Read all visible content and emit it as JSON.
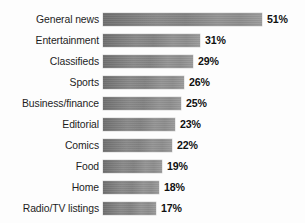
{
  "chart_data": {
    "type": "bar",
    "orientation": "horizontal",
    "title": "",
    "xlabel": "",
    "ylabel": "",
    "xlim": [
      0,
      51
    ],
    "grid": false,
    "legend": false,
    "value_suffix": "%",
    "categories": [
      "General news",
      "Entertainment",
      "Classifieds",
      "Sports",
      "Business/finance",
      "Editorial",
      "Comics",
      "Food",
      "Home",
      "Radio/TV listings"
    ],
    "values": [
      51,
      31,
      29,
      26,
      25,
      23,
      22,
      19,
      18,
      17
    ],
    "value_labels": [
      "51%",
      "31%",
      "29%",
      "26%",
      "25%",
      "23%",
      "22%",
      "19%",
      "18%",
      "17%"
    ]
  },
  "bars": [
    {
      "label": "General news",
      "value": 51,
      "value_label": "51%"
    },
    {
      "label": "Entertainment",
      "value": 31,
      "value_label": "31%"
    },
    {
      "label": "Classifieds",
      "value": 29,
      "value_label": "29%"
    },
    {
      "label": "Sports",
      "value": 26,
      "value_label": "26%"
    },
    {
      "label": "Business/finance",
      "value": 25,
      "value_label": "25%"
    },
    {
      "label": "Editorial",
      "value": 23,
      "value_label": "23%"
    },
    {
      "label": "Comics",
      "value": 22,
      "value_label": "22%"
    },
    {
      "label": "Food",
      "value": 19,
      "value_label": "19%"
    },
    {
      "label": "Home",
      "value": 18,
      "value_label": "18%"
    },
    {
      "label": "Radio/TV listings",
      "value": 17,
      "value_label": "17%"
    }
  ],
  "style": {
    "background": "#fdfdfd",
    "bar_fill_start": "#6f6f6f",
    "bar_fill_end": "#9b9b9b",
    "label_color": "#1d1d1d",
    "value_color": "#101010"
  }
}
